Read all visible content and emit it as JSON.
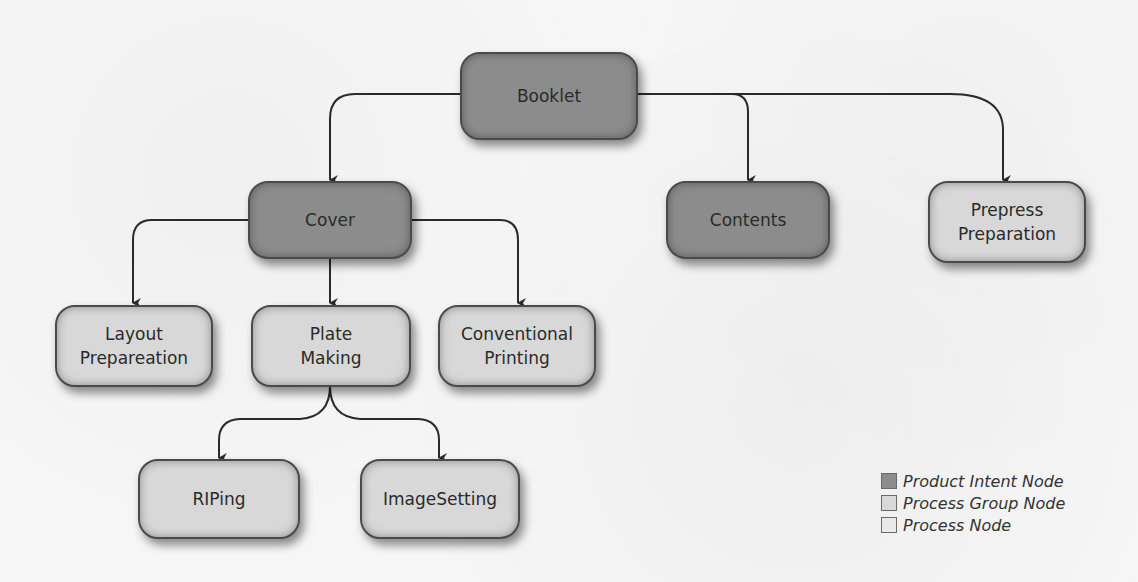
{
  "diagram": {
    "type": "tree",
    "nodes": [
      {
        "id": "booklet",
        "label_lines": [
          "Booklet"
        ],
        "kind": "product-intent"
      },
      {
        "id": "cover",
        "label_lines": [
          "Cover"
        ],
        "kind": "product-intent"
      },
      {
        "id": "contents",
        "label_lines": [
          "Contents"
        ],
        "kind": "product-intent"
      },
      {
        "id": "prepress",
        "label_lines": [
          "Prepress",
          "Preparation"
        ],
        "kind": "process-group"
      },
      {
        "id": "layout",
        "label_lines": [
          "Layout",
          "Prepareation"
        ],
        "kind": "process-group"
      },
      {
        "id": "plate",
        "label_lines": [
          "Plate",
          "Making"
        ],
        "kind": "process-group"
      },
      {
        "id": "printing",
        "label_lines": [
          "Conventional",
          "Printing"
        ],
        "kind": "process-group"
      },
      {
        "id": "riping",
        "label_lines": [
          "RIPing"
        ],
        "kind": "process-group"
      },
      {
        "id": "imagesetting",
        "label_lines": [
          "ImageSetting"
        ],
        "kind": "process-group"
      }
    ],
    "edges": [
      {
        "from": "booklet",
        "to": "cover"
      },
      {
        "from": "booklet",
        "to": "contents"
      },
      {
        "from": "booklet",
        "to": "prepress"
      },
      {
        "from": "cover",
        "to": "layout"
      },
      {
        "from": "cover",
        "to": "plate"
      },
      {
        "from": "cover",
        "to": "printing"
      },
      {
        "from": "plate",
        "to": "riping"
      },
      {
        "from": "plate",
        "to": "imagesetting"
      }
    ]
  },
  "legend": {
    "items": [
      {
        "label": "Product Intent Node",
        "color": "#8c8c8c"
      },
      {
        "label": "Process Group Node",
        "color": "#d8d8d8"
      },
      {
        "label": "Process Node",
        "color": "#e9e9e9"
      }
    ]
  },
  "colors": {
    "product_intent": "#8c8c8c",
    "process_group": "#d8d8d8",
    "process": "#e9e9e9",
    "edge": "#2a2a2a",
    "background": "#f6f6f6"
  }
}
